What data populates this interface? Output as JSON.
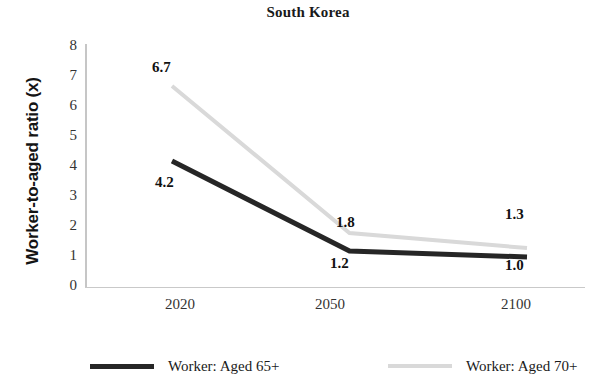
{
  "chart_data": {
    "type": "line",
    "title": "South Korea",
    "xlabel": "",
    "ylabel": "Worker-to-aged ratio (x)",
    "categories": [
      "2020",
      "2050",
      "2100"
    ],
    "ylim": [
      0,
      8
    ],
    "yticks": [
      "0",
      "1",
      "2",
      "3",
      "4",
      "5",
      "6",
      "7",
      "8"
    ],
    "grid": false,
    "legend_position": "bottom",
    "series": [
      {
        "name": "Worker: Aged 65+",
        "color": "#262626",
        "values": [
          4.2,
          1.2,
          1.0
        ],
        "labels": [
          "4.2",
          "1.2",
          "1.0"
        ],
        "label_side": "below"
      },
      {
        "name": "Worker: Aged 70+",
        "color": "#d9d9d9",
        "values": [
          6.7,
          1.8,
          1.3
        ],
        "labels": [
          "6.7",
          "1.8",
          "1.3"
        ],
        "label_side": "above"
      }
    ]
  },
  "axis": {
    "y_title": "Worker-to-aged ratio (x)",
    "y_ticks": [
      "8",
      "7",
      "6",
      "5",
      "4",
      "3",
      "2",
      "1",
      "0"
    ],
    "x_ticks": [
      "2020",
      "2050",
      "2100"
    ]
  },
  "labels": {
    "s1_p1": "4.2",
    "s1_p2": "1.2",
    "s1_p3": "1.0",
    "s2_p1": "6.7",
    "s2_p2": "1.8",
    "s2_p3": "1.3"
  },
  "legend": {
    "items": [
      {
        "label": "Worker: Aged 65+",
        "color": "#262626"
      },
      {
        "label": "Worker: Aged 70+",
        "color": "#d9d9d9"
      }
    ]
  }
}
